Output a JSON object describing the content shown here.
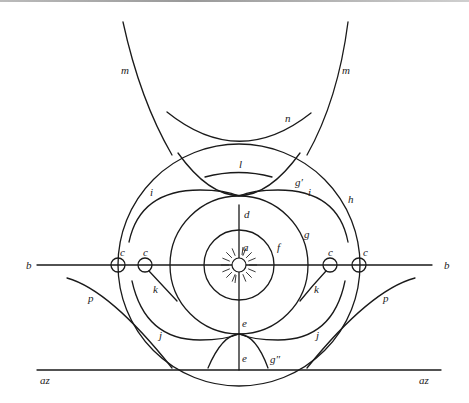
{
  "diagram": {
    "title": "",
    "labels": {
      "m_left": "m",
      "m_right": "m",
      "n": "n",
      "l": "l",
      "g_prime": "g′",
      "i_left": "i",
      "i_right": "i",
      "h": "h",
      "d": "d",
      "a": "a",
      "f": "f",
      "g": "g",
      "b_left": "b",
      "b_right": "b",
      "c_outer_left": "c",
      "c_inner_left": "c",
      "c_inner_right": "c",
      "c_outer_right": "c",
      "k_left": "k",
      "k_right": "k",
      "p_left": "p",
      "p_right": "p",
      "e_upper": "e",
      "e_lower": "e",
      "j_left": "j",
      "j_right": "j",
      "g_double_prime": "g″",
      "az_left": "az",
      "az_right": "az"
    },
    "elements": {
      "sun": "sun-icon",
      "circles": [
        "f",
        "g",
        "h"
      ],
      "axis_horizontal": "b",
      "axis_vertical": "d–e",
      "baseline": "az"
    },
    "colors": {
      "stroke": "#1a1a1a",
      "background": "#ffffff"
    }
  }
}
